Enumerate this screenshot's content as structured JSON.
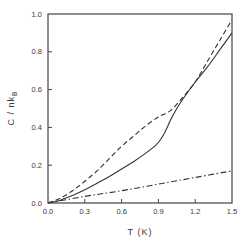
{
  "chart_data": {
    "type": "line",
    "title": "",
    "xlabel": "T  (K)",
    "ylabel": "C / nk",
    "ylabel_subscript": "B",
    "xlim": [
      0.0,
      1.5
    ],
    "ylim": [
      0.0,
      1.0
    ],
    "grid": false,
    "legend": null,
    "x_ticks": [
      "0.0",
      "0.3",
      "0.6",
      "0.9",
      "1.2",
      "1.5"
    ],
    "y_ticks": [
      "0.0",
      "0.2",
      "0.4",
      "0.6",
      "0.8",
      "1.0"
    ],
    "series": [
      {
        "name": "solid",
        "style": "solid",
        "x": [
          0.0,
          0.1,
          0.2,
          0.3,
          0.4,
          0.5,
          0.6,
          0.7,
          0.8,
          0.85,
          0.9,
          0.95,
          1.0,
          1.05,
          1.1,
          1.2,
          1.3,
          1.4,
          1.5
        ],
        "y": [
          0.0,
          0.015,
          0.04,
          0.07,
          0.105,
          0.14,
          0.18,
          0.22,
          0.265,
          0.29,
          0.32,
          0.37,
          0.44,
          0.5,
          0.55,
          0.64,
          0.72,
          0.81,
          0.9
        ]
      },
      {
        "name": "dashed",
        "style": "dashed",
        "x": [
          0.0,
          0.1,
          0.2,
          0.3,
          0.4,
          0.5,
          0.6,
          0.7,
          0.8,
          0.9,
          1.0,
          1.1,
          1.2,
          1.3,
          1.4,
          1.5
        ],
        "y": [
          0.0,
          0.025,
          0.065,
          0.115,
          0.17,
          0.235,
          0.3,
          0.355,
          0.41,
          0.455,
          0.49,
          0.56,
          0.64,
          0.75,
          0.86,
          0.97
        ]
      },
      {
        "name": "dash-dot",
        "style": "dash-dot",
        "x": [
          0.0,
          0.3,
          0.6,
          0.9,
          1.2,
          1.5
        ],
        "y": [
          0.0,
          0.035,
          0.065,
          0.1,
          0.135,
          0.17
        ]
      }
    ]
  }
}
